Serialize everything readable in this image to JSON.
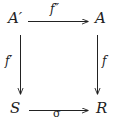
{
  "diagram": {
    "kind": "commutative-square",
    "background_color": "#ffffff",
    "ink_color": "#222222",
    "nodes": {
      "top_left": "A′",
      "top_right": "A",
      "bottom_left": "S",
      "bottom_right": "R"
    },
    "edges": {
      "top": {
        "label": "f″",
        "from": "A′",
        "to": "A",
        "direction": "right"
      },
      "left": {
        "label": "f′",
        "from": "A′",
        "to": "S",
        "direction": "down"
      },
      "right": {
        "label": "f",
        "from": "A",
        "to": "R",
        "direction": "down"
      },
      "bottom": {
        "label": "σ",
        "from": "S",
        "to": "R",
        "direction": "right"
      }
    }
  }
}
